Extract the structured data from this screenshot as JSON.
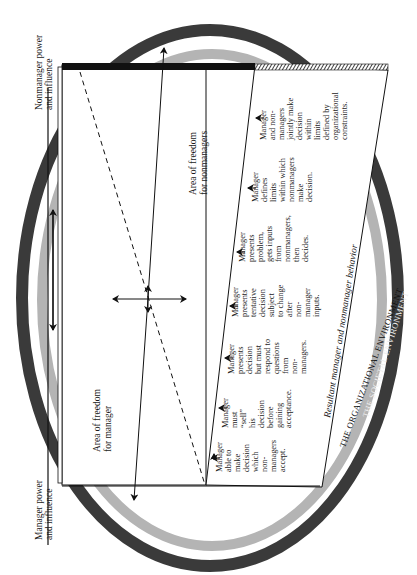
{
  "diagram": {
    "type": "continuum-of-leadership-behavior",
    "orientation": "rotated-90-ccw",
    "axis_labels": {
      "nonmanager_power": [
        "Nonmanager power",
        "and influence"
      ],
      "manager_power": [
        "Manager power",
        "and influence"
      ]
    },
    "areas": {
      "manager": [
        "Area of freedom",
        "for manager"
      ],
      "nonmanagers": [
        "Area of freedom",
        "for nonmanagers"
      ]
    },
    "resultant_label": "Resultant manager and nonmanager behavior",
    "environments": {
      "organizational": "THE ORGANIZATIONAL ENVIRONMENT",
      "societal": "THE SOCIETAL ENVIRONMENT"
    },
    "behaviors": [
      {
        "lines": [
          "Manager",
          "able to",
          "make",
          "decision",
          "which",
          "non-",
          "managers",
          "accept."
        ]
      },
      {
        "lines": [
          "Manager",
          "must",
          "“sell”",
          "his",
          "decision",
          "before",
          "gaining",
          "acceptance."
        ]
      },
      {
        "lines": [
          "Manager",
          "presents",
          "decision",
          "but must",
          "respond to",
          "questions",
          "from",
          "non-",
          "managers."
        ]
      },
      {
        "lines": [
          "Manager",
          "presents",
          "tentative",
          "decision",
          "subject",
          "to change",
          "after",
          "non-",
          "manager",
          "inputs."
        ]
      },
      {
        "lines": [
          "Manager",
          "presents",
          "problem,",
          "gets inputs",
          "from",
          "nonmanagers,",
          "then",
          "decides."
        ]
      },
      {
        "lines": [
          "Manager",
          "defines",
          "limits",
          "within which",
          "nonmanagers",
          "make",
          "decision."
        ]
      },
      {
        "lines": [
          "Manager",
          "and non-",
          "managers",
          "jointly make",
          "decision",
          "within",
          "limits",
          "defined by",
          "organizational",
          "constraints."
        ]
      }
    ],
    "colors": {
      "societal_ring": "#3a3a3a",
      "organizational_ring": "#b4b4b4",
      "ink": "#1a1a1a",
      "paper": "#ffffff"
    }
  }
}
